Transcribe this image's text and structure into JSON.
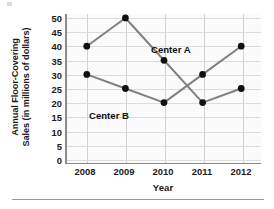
{
  "chart_data": {
    "type": "line",
    "title": "",
    "xlabel": "Year",
    "ylabel": "Annual Floor-Covering Sales (in millions of dollars)",
    "ylabel_line1": "Annual Floor-Covering",
    "ylabel_line2": "Sales (in millions of dollars)",
    "categories": [
      "2008",
      "2009",
      "2010",
      "2011",
      "2012"
    ],
    "x": [
      2008,
      2009,
      2010,
      2011,
      2012
    ],
    "ylim": [
      0,
      50
    ],
    "ytick_values": [
      0,
      5,
      10,
      15,
      20,
      25,
      30,
      35,
      40,
      45,
      50
    ],
    "ytick_labels": [
      "0",
      "5",
      "10",
      "15",
      "20",
      "25",
      "30",
      "35",
      "40",
      "45",
      "50"
    ],
    "grid": true,
    "legend_position": "inline-annotation",
    "series": [
      {
        "name": "Center A",
        "values": [
          40,
          50,
          35,
          20,
          25
        ],
        "color": "#808080",
        "marker_color": "#111111"
      },
      {
        "name": "Center B",
        "values": [
          30,
          25,
          20,
          30,
          40
        ],
        "color": "#808080",
        "marker_color": "#111111"
      }
    ],
    "annotations": [
      {
        "text": "Center A",
        "series": "Center A"
      },
      {
        "text": "Center B",
        "series": "Center B"
      }
    ]
  },
  "axis": {
    "line_color": "#8a8a8a",
    "grid_color": "#dcdcdc",
    "plot_background": "#fbfbfb"
  }
}
